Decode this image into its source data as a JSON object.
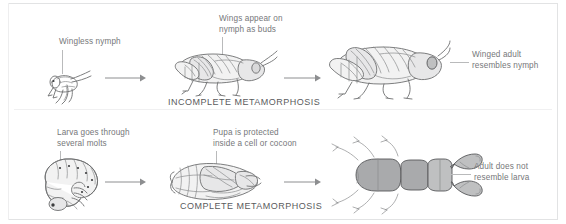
{
  "figure": {
    "sections": [
      {
        "id": "incomplete",
        "title": "INCOMPLETE METAMORPHOSIS",
        "stages": [
          {
            "name": "nymph",
            "label": "Wingless nymph"
          },
          {
            "name": "older-nymph",
            "label": "Wings appear on\nnymph as buds"
          },
          {
            "name": "adult-grasshopper",
            "label": "Winged adult\nresembles nymph"
          }
        ]
      },
      {
        "id": "complete",
        "title": "COMPLETE METAMORPHOSIS",
        "stages": [
          {
            "name": "larva",
            "label": "Larva goes through\nseveral molts"
          },
          {
            "name": "pupa",
            "label": "Pupa is protected\ninside a cell or cocoon"
          },
          {
            "name": "adult-beetle",
            "label": "Adult does not\nresemble larva"
          }
        ]
      }
    ],
    "arrows": [
      {
        "name": "arrow-nymph-to-older-nymph"
      },
      {
        "name": "arrow-older-nymph-to-adult"
      },
      {
        "name": "arrow-larva-to-pupa"
      },
      {
        "name": "arrow-pupa-to-adult"
      }
    ],
    "colors": {
      "text": "#76777a",
      "title": "#5a5b5d",
      "line": "#6e6f71",
      "leader": "#b9babb",
      "frame": "#e2e3e4",
      "background": "#ffffff"
    }
  }
}
